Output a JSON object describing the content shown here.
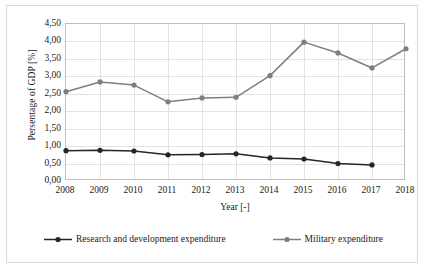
{
  "chart_data": {
    "type": "line",
    "title": "",
    "xlabel": "Year [-]",
    "ylabel": "Persentage of GDP [%]",
    "x": [
      2008,
      2009,
      2010,
      2011,
      2012,
      2013,
      2014,
      2015,
      2016,
      2017,
      2018
    ],
    "categories": [
      "2008",
      "2009",
      "2010",
      "2011",
      "2012",
      "2013",
      "2014",
      "2015",
      "2016",
      "2017",
      "2018"
    ],
    "xlim": [
      2008,
      2018
    ],
    "ylim": [
      0.0,
      4.5
    ],
    "ytick_labels": [
      "0,00",
      "0,50",
      "1,00",
      "1,50",
      "2,00",
      "2,50",
      "3,00",
      "3,50",
      "4,00",
      "4,50"
    ],
    "ytick_values": [
      0.0,
      0.5,
      1.0,
      1.5,
      2.0,
      2.5,
      3.0,
      3.5,
      4.0,
      4.5
    ],
    "grid": true,
    "legend_position": "bottom",
    "series": [
      {
        "name": "Research and development expenditure",
        "color": "#262626",
        "marker": "circle",
        "values": [
          0.87,
          0.88,
          0.86,
          0.75,
          0.76,
          0.78,
          0.66,
          0.63,
          0.5,
          0.46,
          null
        ]
      },
      {
        "name": "Military expenditure",
        "color": "#7f7f7f",
        "marker": "circle",
        "values": [
          2.56,
          2.84,
          2.75,
          2.27,
          2.38,
          2.4,
          3.02,
          3.98,
          3.67,
          3.24,
          3.79
        ]
      }
    ]
  },
  "legend": {
    "items": [
      {
        "label": "Research and development expenditure",
        "color": "#262626"
      },
      {
        "label": "Military expenditure",
        "color": "#7f7f7f"
      }
    ]
  },
  "colors": {
    "rnd": "#262626",
    "military": "#7f7f7f",
    "grid": "#e2e2e2",
    "frame": "#bfbfbf",
    "outer_border": "#d9d9d9",
    "text": "#1a1a1a",
    "background": "#ffffff"
  }
}
